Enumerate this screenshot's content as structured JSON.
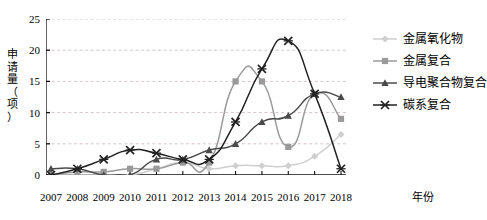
{
  "chart_data": {
    "type": "line",
    "title": "",
    "xlabel": "年份",
    "ylabel": "申请量（项）",
    "ylabel_chars": [
      "申",
      "请",
      "量",
      "（",
      "项",
      "）"
    ],
    "categories": [
      "2007",
      "2008",
      "2009",
      "2010",
      "2011",
      "2012",
      "2013",
      "2014",
      "2015",
      "2016",
      "2017",
      "2018"
    ],
    "ylim": [
      0,
      25
    ],
    "yticks": [
      "0",
      "5",
      "10",
      "15",
      "20",
      "25"
    ],
    "ytick_values": [
      0,
      5,
      10,
      15,
      20,
      25
    ],
    "grid": "horizontal-dashed",
    "legend_position": "right",
    "series": [
      {
        "name": "金属氧化物",
        "color": "#cfcfcf",
        "marker": "diamond",
        "values": [
          0,
          0,
          0,
          0,
          1,
          2,
          1,
          1.5,
          1.5,
          1.5,
          3,
          6.5
        ]
      },
      {
        "name": "金属复合",
        "color": "#9a9a9a",
        "marker": "square",
        "values": [
          0,
          0.5,
          0.5,
          1,
          1,
          2,
          2,
          15,
          15,
          4.5,
          13,
          9
        ]
      },
      {
        "name": "导电聚合物复合",
        "color": "#4a4a4a",
        "marker": "triangle",
        "values": [
          1,
          1,
          0,
          0,
          2.5,
          2.5,
          4,
          5,
          8.5,
          9.5,
          13,
          12.5
        ]
      },
      {
        "name": "碳系复合",
        "color": "#222222",
        "marker": "x",
        "values": [
          0,
          1,
          2.5,
          4,
          3.5,
          2.5,
          2.5,
          8.5,
          17,
          21.5,
          13,
          1
        ]
      }
    ]
  }
}
